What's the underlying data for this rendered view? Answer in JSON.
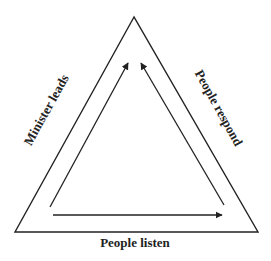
{
  "diagram": {
    "labels": {
      "left": "Minister leads",
      "right": "People respond",
      "bottom": "People listen"
    },
    "colors": {
      "line": "#222222",
      "background": "#ffffff"
    }
  }
}
